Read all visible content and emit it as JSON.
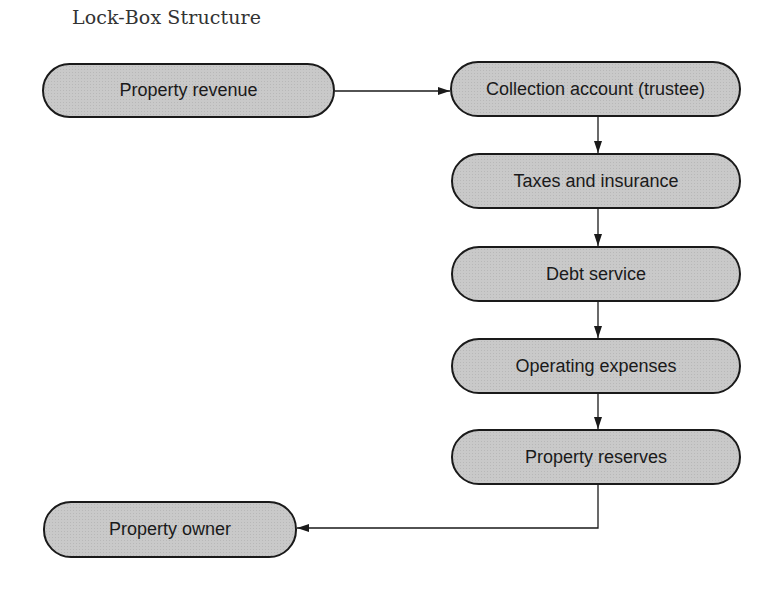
{
  "title": "Lock-Box Structure",
  "nodes": {
    "property_revenue": "Property revenue",
    "collection_account": "Collection account (trustee)",
    "taxes_insurance": "Taxes and insurance",
    "debt_service": "Debt service",
    "operating_expenses": "Operating expenses",
    "property_reserves": "Property reserves",
    "property_owner": "Property owner"
  },
  "edges": [
    {
      "from": "property_revenue",
      "to": "collection_account"
    },
    {
      "from": "collection_account",
      "to": "taxes_insurance"
    },
    {
      "from": "taxes_insurance",
      "to": "debt_service"
    },
    {
      "from": "debt_service",
      "to": "operating_expenses"
    },
    {
      "from": "operating_expenses",
      "to": "property_reserves"
    },
    {
      "from": "property_reserves",
      "to": "property_owner"
    }
  ],
  "colors": {
    "node_fill": "#c9c9c9",
    "stroke": "#1a1a1a"
  }
}
